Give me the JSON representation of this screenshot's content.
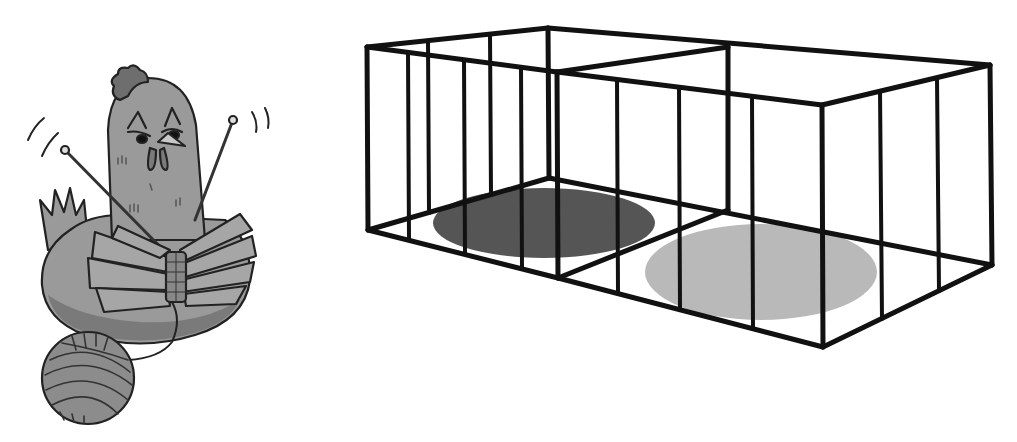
{
  "scene": {
    "description": "Cartoon hen knitting with needles and yarn next to an empty two-compartment wire cage",
    "background": "#ffffff"
  },
  "hen": {
    "label": "knitting hen",
    "colors": {
      "body": "#9a9a9a",
      "body_shadow": "#7a7a7a",
      "outline": "#222222",
      "comb": "#6e6e6e",
      "beak": "#c8c8c8",
      "wing": "#a6a6a6",
      "knitting": "#888888",
      "needle": "#444444",
      "yarn": "#8c8c8c"
    }
  },
  "yarn_ball": {
    "label": "ball of yarn",
    "cx": 88,
    "cy": 378,
    "r": 46
  },
  "cage": {
    "label": "two-compartment cage",
    "bar_color": "#111111",
    "bar_width": 5,
    "compartments": [
      {
        "name": "left",
        "floor_spot": {
          "cx": 544,
          "cy": 223,
          "rx": 111,
          "ry": 35,
          "color": "#555555"
        }
      },
      {
        "name": "right",
        "floor_spot": {
          "cx": 761,
          "cy": 272,
          "rx": 116,
          "ry": 48,
          "color": "#b9b9b9"
        }
      }
    ]
  }
}
